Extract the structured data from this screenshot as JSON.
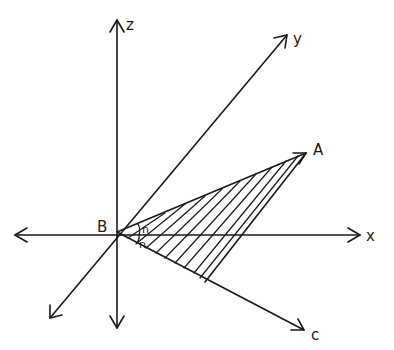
{
  "diagram": {
    "type": "3d-axes-sketch",
    "origin": {
      "label": "B",
      "x": 117,
      "y": 232
    },
    "axes": [
      {
        "name": "z-axis",
        "label": "z",
        "from": [
          117,
          328
        ],
        "to": [
          117,
          20
        ],
        "label_pos": [
          126,
          28
        ]
      },
      {
        "name": "y-axis",
        "label": "y",
        "from": [
          50,
          318
        ],
        "to": [
          287,
          35
        ],
        "label_pos": [
          293,
          42
        ]
      },
      {
        "name": "x-axis",
        "label": "x",
        "from": [
          15,
          235
        ],
        "to": [
          360,
          235
        ],
        "label_pos": [
          366,
          240
        ]
      }
    ],
    "rays": [
      {
        "name": "ray-BA",
        "label": "A",
        "from": [
          117,
          232
        ],
        "to": [
          306,
          153
        ],
        "label_pos": [
          313,
          153
        ]
      },
      {
        "name": "ray-BC",
        "label": "c",
        "from": [
          117,
          232
        ],
        "to": [
          304,
          330
        ],
        "label_pos": [
          311,
          338
        ]
      }
    ],
    "angles": [
      {
        "name": "angle-upper",
        "label": "n",
        "pos": [
          143,
          232
        ]
      },
      {
        "name": "angle-lower",
        "label": "n",
        "pos": [
          140,
          247
        ]
      }
    ],
    "shaded_region": {
      "name": "hatched-triangle",
      "vertices": [
        [
          117,
          232
        ],
        [
          306,
          153
        ],
        [
          205,
          282
        ]
      ],
      "pattern": "diagonal-hatch"
    }
  },
  "labels": {
    "origin": "B",
    "z": "z",
    "y": "y",
    "x": "x",
    "A": "A",
    "C": "c",
    "angle1": "n",
    "angle2": "n"
  }
}
